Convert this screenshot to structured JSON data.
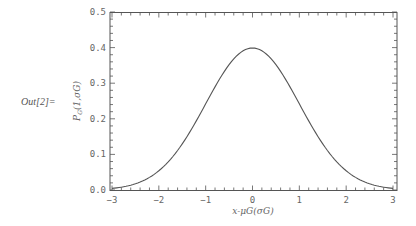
{
  "cell": {
    "output_label": "Out[2]="
  },
  "chart_data": {
    "type": "line",
    "title": "",
    "xlabel": "x-μG(σG)",
    "ylabel": "P_G(1,σG)",
    "xlim": [
      -3,
      3
    ],
    "ylim": [
      0,
      0.5
    ],
    "x_ticks": [
      "-3",
      "-2",
      "-1",
      "0",
      "1",
      "2",
      "3"
    ],
    "y_ticks": [
      "0.0",
      "0.1",
      "0.2",
      "0.3",
      "0.4",
      "0.5"
    ],
    "grid": false,
    "legend": null,
    "series": [
      {
        "name": "Standard normal PDF",
        "x": [
          -3,
          -2.5,
          -2,
          -1.5,
          -1,
          -0.5,
          0,
          0.5,
          1,
          1.5,
          2,
          2.5,
          3
        ],
        "y": [
          0.0044,
          0.0175,
          0.054,
          0.1295,
          0.242,
          0.3521,
          0.3989,
          0.3521,
          0.242,
          0.1295,
          0.054,
          0.0175,
          0.0044
        ],
        "color": "#555555"
      }
    ]
  }
}
